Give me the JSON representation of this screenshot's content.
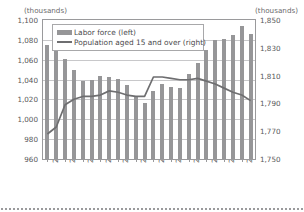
{
  "units": {
    "left_label": "(thousands)",
    "right_label": "(thousands)"
  },
  "legend": {
    "items": [
      {
        "label": "Labor force (left)",
        "marker": "bar-swatch",
        "color": "#969698"
      },
      {
        "label": "Population aged 15 and over (right)",
        "marker": "line-swatch",
        "color": "#6e6e70"
      }
    ]
  },
  "axes": {
    "left_ticks": [
      "1,100",
      "1,080",
      "1,060",
      "1,040",
      "1,020",
      "1,000",
      "980",
      "960"
    ],
    "right_ticks": [
      "1,850",
      "1,830",
      "1,810",
      "1,790",
      "1,770",
      "1,750"
    ],
    "x_ticks": [
      "2000",
      "2002",
      "2004",
      "2006",
      "2008",
      "2010",
      "2012",
      "2014",
      "2016",
      "2018",
      "2020",
      "2022"
    ]
  },
  "chart_data": {
    "type": "bar",
    "title": "",
    "subtitle": "",
    "xlabel": "",
    "ylabel": "(thousands)",
    "y2label": "(thousands)",
    "grid": true,
    "legend_position": "top-left-inside",
    "ylim": [
      960,
      1100
    ],
    "y2lim": [
      1750,
      1850
    ],
    "categories": [
      "2000",
      "2001",
      "2002",
      "2003",
      "2004",
      "2005",
      "2006",
      "2007",
      "2008",
      "2009",
      "2010",
      "2011",
      "2012",
      "2013",
      "2014",
      "2015",
      "2016",
      "2017",
      "2018",
      "2019",
      "2020",
      "2021",
      "2022",
      "2023"
    ],
    "series": [
      {
        "name": "Labor force (left)",
        "type": "bar",
        "axis": "left",
        "unit": "thousands",
        "color": "#969698",
        "values": [
          1075,
          1071,
          1061,
          1050,
          1039,
          1040,
          1044,
          1043,
          1041,
          1035,
          1023,
          1016,
          1029,
          1036,
          1033,
          1032,
          1046,
          1057,
          1070,
          1080,
          1081,
          1085,
          1094,
          1086
        ]
      },
      {
        "name": "Population aged 15 and over (right)",
        "type": "line",
        "axis": "right",
        "unit": "thousands",
        "color": "#6e6e70",
        "values": [
          1768,
          1773,
          1789,
          1793,
          1795,
          1795,
          1796,
          1799,
          1798,
          1796,
          1795,
          1795,
          1809,
          1809,
          1808,
          1807,
          1807,
          1808,
          1806,
          1804,
          1801,
          1798,
          1796,
          1792
        ]
      }
    ]
  }
}
